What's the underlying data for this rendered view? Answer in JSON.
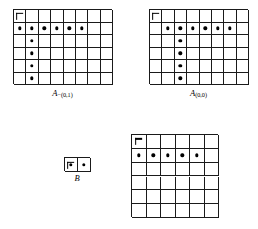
{
  "figure": {
    "background_color": "#ffffff",
    "line_color": "#1a1a1a",
    "dot_color": "#000000",
    "panels": [
      {
        "id": "panel-a-minus-01",
        "caption_name": "A",
        "caption_subscript": "−(0,1)",
        "caption_text": "A−(0,1)",
        "cols": 8,
        "rows": 6,
        "origin": {
          "col": 1,
          "row": 1
        },
        "dots": [
          {
            "col": 1,
            "row": 2
          },
          {
            "col": 2,
            "row": 2
          },
          {
            "col": 3,
            "row": 2
          },
          {
            "col": 4,
            "row": 2
          },
          {
            "col": 5,
            "row": 2
          },
          {
            "col": 6,
            "row": 2
          },
          {
            "col": 2,
            "row": 3
          },
          {
            "col": 2,
            "row": 4
          },
          {
            "col": 2,
            "row": 5
          },
          {
            "col": 2,
            "row": 6
          }
        ]
      },
      {
        "id": "panel-a-00",
        "caption_name": "A",
        "caption_subscript": "(0,0)",
        "caption_text": "A(0,0)",
        "cols": 8,
        "rows": 6,
        "origin": {
          "col": 1,
          "row": 1
        },
        "dots": [
          {
            "col": 2,
            "row": 2
          },
          {
            "col": 3,
            "row": 2
          },
          {
            "col": 4,
            "row": 2
          },
          {
            "col": 5,
            "row": 2
          },
          {
            "col": 6,
            "row": 2
          },
          {
            "col": 7,
            "row": 2
          },
          {
            "col": 3,
            "row": 3
          },
          {
            "col": 3,
            "row": 4
          },
          {
            "col": 3,
            "row": 5
          },
          {
            "col": 3,
            "row": 6
          }
        ]
      },
      {
        "id": "panel-b",
        "caption_name": "B",
        "caption_subscript": "",
        "caption_text": "B",
        "cols": 2,
        "rows": 1,
        "origin": {
          "col": 1,
          "row": 1
        },
        "dots": [
          {
            "col": 1,
            "row": 1
          },
          {
            "col": 2,
            "row": 1
          }
        ]
      },
      {
        "id": "panel-result",
        "caption_name": "",
        "caption_subscript": "",
        "caption_text": "",
        "cols": 6,
        "rows": 6,
        "origin": {
          "col": 1,
          "row": 1
        },
        "dots": [
          {
            "col": 1,
            "row": 2
          },
          {
            "col": 2,
            "row": 2
          },
          {
            "col": 3,
            "row": 2
          },
          {
            "col": 4,
            "row": 2
          },
          {
            "col": 5,
            "row": 2
          }
        ]
      }
    ]
  }
}
